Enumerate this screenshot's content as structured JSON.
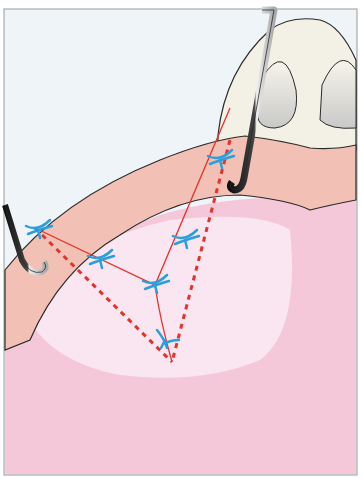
{
  "figure": {
    "colors": {
      "background": "#eef4f8",
      "tissue_pink": "#f4c8d8",
      "tissue_light": "#fbe9f3",
      "band_salmon": "#f2c0b4",
      "tooth": "#f3f1e6",
      "outline": "#2a2a2a",
      "incision_red": "#e2332c",
      "suture_blue": "#2a9fdc",
      "instrument_dark": "#1d1d1d",
      "instrument_light": "#d9d9d9"
    },
    "elements": {
      "instruments": [
        "left-skin-hook",
        "right-skin-hook"
      ],
      "sutures_count": 6,
      "incision_lines": [
        "dashed-left",
        "dashed-right",
        "solid-y-line"
      ]
    }
  }
}
